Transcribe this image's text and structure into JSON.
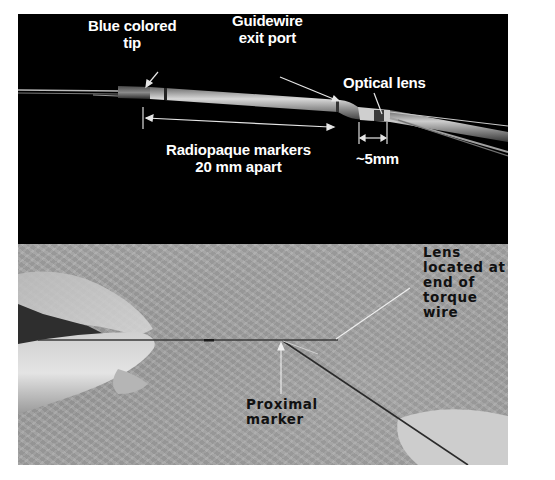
{
  "figure": {
    "top_panel": {
      "background": "#000000",
      "annotations": {
        "blue_tip": {
          "line1": "Blue colored",
          "line2": "tip"
        },
        "guidewire_port": {
          "line1": "Guidewire",
          "line2": "exit port"
        },
        "optical_lens": {
          "line1": "Optical lens"
        },
        "markers": {
          "line1": "Radiopaque markers",
          "line2": "20 mm apart"
        },
        "distance": {
          "line1": "~5mm"
        }
      }
    },
    "bottom_panel": {
      "background": "#a3a3a3",
      "annotations": {
        "lens_location": {
          "lines": [
            "Lens",
            "located at",
            "end of",
            "torque",
            "wire"
          ]
        },
        "proximal_marker": {
          "line1": "Proximal",
          "line2": "marker"
        }
      }
    }
  }
}
